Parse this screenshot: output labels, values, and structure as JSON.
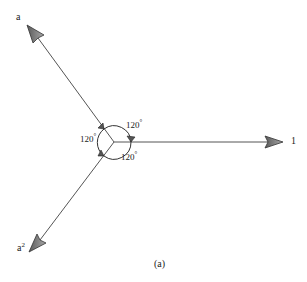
{
  "diagram": {
    "type": "phasor-diagram",
    "caption": "(a)",
    "center": {
      "x": 114,
      "y": 143
    },
    "vectors": [
      {
        "name": "vector-1",
        "label": "1",
        "angle_deg": 0,
        "tip": {
          "x": 283,
          "y": 142
        }
      },
      {
        "name": "vector-a",
        "label": "a",
        "angle_deg": 120,
        "tip": {
          "x": 27,
          "y": 25
        }
      },
      {
        "name": "vector-a2",
        "label_base": "a",
        "label_sup": "2",
        "angle_deg": 240,
        "tip": {
          "x": 29,
          "y": 252
        }
      }
    ],
    "angles": [
      {
        "name": "angle-upper",
        "text": "120",
        "unit": "°"
      },
      {
        "name": "angle-left",
        "text": "120",
        "unit": "°"
      },
      {
        "name": "angle-lower",
        "text": "120",
        "unit": "°"
      }
    ],
    "colors": {
      "line": "#555555",
      "arrowhead_fill": "#8a8a8a",
      "arrowhead_stroke": "#333333",
      "text": "#222222"
    }
  }
}
